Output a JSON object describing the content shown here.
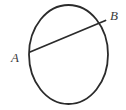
{
  "figure": {
    "kind": "geometry-diagram",
    "background_color": "#ffffff",
    "stroke_color": "#2b2b2b",
    "label_color": "#3b3b3b",
    "circle": {
      "name": "circle-outline",
      "center_x": 68.5,
      "center_y": 54.5,
      "radius_x": 39.5,
      "radius_y": 49.5,
      "stroke_width": 1.8,
      "fill": "none"
    },
    "chord": {
      "name": "chord-ab",
      "x1": 30,
      "y1": 52,
      "x2": 105.5,
      "y2": 20.5,
      "stroke_width": 1.8
    },
    "labels": [
      {
        "id": "a",
        "text": "A",
        "x": 11,
        "y": 51
      },
      {
        "id": "b",
        "text": "B",
        "x": 110,
        "y": 9
      }
    ]
  }
}
